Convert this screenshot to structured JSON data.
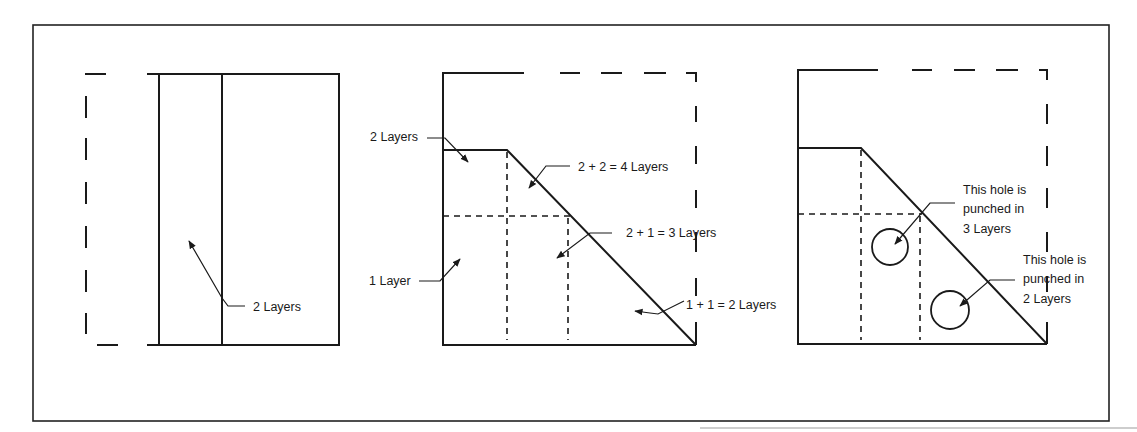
{
  "figure": {
    "line_color": "#1a1a1a",
    "background": "#ffffff"
  },
  "panels": [
    {
      "id": "panel-1",
      "labels": [
        {
          "text": "2 Layers",
          "x": 253,
          "y": 311
        }
      ]
    },
    {
      "id": "panel-2",
      "labels": [
        {
          "text": "2 Layers",
          "x": 370,
          "y": 141
        },
        {
          "text": "2 + 2 = 4 Layers",
          "x": 578,
          "y": 171
        },
        {
          "text": "2 + 1 = 3 Layers",
          "x": 626,
          "y": 237
        },
        {
          "text": "1 Layer",
          "x": 369,
          "y": 285
        },
        {
          "text": "1 + 1 = 2 Layers",
          "x": 686,
          "y": 309
        }
      ]
    },
    {
      "id": "panel-3",
      "labels": [
        {
          "text": "This hole is",
          "x": 963,
          "y": 194
        },
        {
          "text": "punched in",
          "x": 963,
          "y": 213
        },
        {
          "text": "3 Layers",
          "x": 963,
          "y": 233
        },
        {
          "text": "This hole is",
          "x": 1023,
          "y": 264
        },
        {
          "text": "punched in",
          "x": 1023,
          "y": 283
        },
        {
          "text": "2 Layers",
          "x": 1023,
          "y": 303
        }
      ],
      "holes": [
        {
          "cx": 890,
          "cy": 247,
          "r": 18,
          "layers": 3
        },
        {
          "cx": 950,
          "cy": 310,
          "r": 19,
          "layers": 2
        }
      ]
    }
  ]
}
